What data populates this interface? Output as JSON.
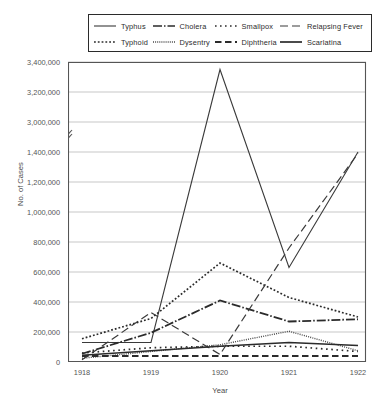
{
  "chart_data": {
    "type": "line",
    "title": "",
    "xlabel": "Year",
    "ylabel": "No. of Cases",
    "x": [
      1918,
      1919,
      1920,
      1921,
      1922
    ],
    "xtick_labels": [
      "1918",
      "1919",
      "1920",
      "1921",
      "1922"
    ],
    "ytick_labels": [
      "0",
      "200,000",
      "400,000",
      "600,000",
      "800,000",
      "1,000,000",
      "1,200,000",
      "1,400,000",
      "3,000,000",
      "3,200,000",
      "3,400,000"
    ],
    "ytick_values": [
      0,
      200000,
      400000,
      600000,
      800000,
      1000000,
      1200000,
      1400000,
      3000000,
      3200000,
      3400000
    ],
    "ylim": [
      0,
      3400000
    ],
    "axis_break": {
      "present": true,
      "between": [
        1400000,
        3000000
      ],
      "marker": "zigzag"
    },
    "grid": "horizontal",
    "legend_position": "top",
    "series": [
      {
        "name": "Typhus",
        "style": "solid",
        "color": "#3a3a3a",
        "values": [
          130000,
          1530000,
          3350000,
          630000,
          1400000
        ]
      },
      {
        "name": "Typhoid",
        "style": "dotted",
        "color": "#2b2b2b",
        "values": [
          155000,
          290000,
          660000,
          430000,
          300000
        ]
      },
      {
        "name": "Cholera",
        "style": "dashdot",
        "color": "#2b2b2b",
        "values": [
          55000,
          195000,
          410000,
          270000,
          285000
        ]
      },
      {
        "name": "Dysentry",
        "style": "fine-dotted",
        "color": "#4a4a4a",
        "values": [
          25000,
          70000,
          115000,
          205000,
          75000
        ]
      },
      {
        "name": "Smallpox",
        "style": "loose-dotted",
        "color": "#2b2b2b",
        "values": [
          60000,
          95000,
          105000,
          105000,
          70000
        ]
      },
      {
        "name": "Diphtheria",
        "style": "dashed-thick",
        "color": "#2b2b2b",
        "values": [
          40000,
          40000,
          40000,
          40000,
          40000
        ]
      },
      {
        "name": "Relapsing Fever",
        "style": "long-dashed",
        "color": "#3a3a3a",
        "values": [
          15000,
          330000,
          1450000,
          760000,
          1390000
        ]
      },
      {
        "name": "Scarlatina",
        "style": "solid-thin",
        "color": "#2b2b2b",
        "values": [
          45000,
          75000,
          105000,
          130000,
          110000
        ]
      }
    ]
  },
  "legend": {
    "rows": [
      [
        {
          "label": "Typhus",
          "icon": "line-solid-swatch"
        },
        {
          "label": "Cholera",
          "icon": "line-dashdot-swatch"
        },
        {
          "label": "Smallpox",
          "icon": "line-loose-dotted-swatch"
        },
        {
          "label": "Relapsing Fever",
          "icon": "line-long-dashed-swatch"
        }
      ],
      [
        {
          "label": "Typhoid",
          "icon": "line-dotted-swatch"
        },
        {
          "label": "Dysentry",
          "icon": "line-fine-dotted-swatch"
        },
        {
          "label": "Diphtheria",
          "icon": "line-dashed-thick-swatch"
        },
        {
          "label": "Scarlatina",
          "icon": "line-solid-thin-swatch"
        }
      ]
    ]
  }
}
